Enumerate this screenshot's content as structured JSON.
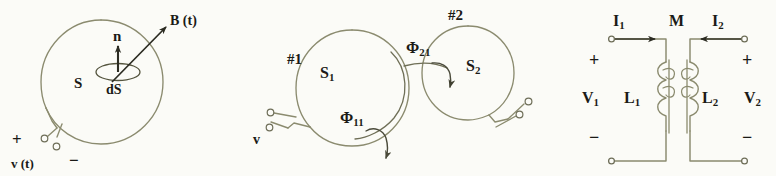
{
  "figure": {
    "background_color": "#fbfbf7",
    "ink_color": "#8b8b6f",
    "text_color": "#1a1a16",
    "width": 776,
    "height": 176
  },
  "panels": [
    {
      "id": "panel-faraday-loop",
      "name": "single-loop-flux-diagram",
      "labels": {
        "b_field": "B (t)",
        "normal": "n",
        "area_element": "dS",
        "surface": "S",
        "plus": "+",
        "minus": "−",
        "source": "v (t)"
      }
    },
    {
      "id": "panel-mutual-coupling",
      "name": "two-loop-mutual-flux-diagram",
      "labels": {
        "loop1_number": "#1",
        "loop2_number": "#2",
        "surface1": "S",
        "surface1_sub": "1",
        "surface2": "S",
        "surface2_sub": "2",
        "flux_self": "Φ",
        "flux_self_sub": "11",
        "flux_mutual": "Φ",
        "flux_mutual_sub": "21",
        "source": "v"
      }
    },
    {
      "id": "panel-transformer-circuit",
      "name": "coupled-inductor-circuit",
      "labels": {
        "current_left": "I",
        "current_left_sub": "1",
        "current_right": "I",
        "current_right_sub": "2",
        "mutual_inductance": "M",
        "voltage_left": "V",
        "voltage_left_sub": "1",
        "voltage_right": "V",
        "voltage_right_sub": "2",
        "inductor_left": "L",
        "inductor_left_sub": "1",
        "inductor_right": "L",
        "inductor_right_sub": "2",
        "plus_left": "+",
        "plus_right": "+",
        "minus_left": "−",
        "minus_right": "−"
      }
    }
  ]
}
